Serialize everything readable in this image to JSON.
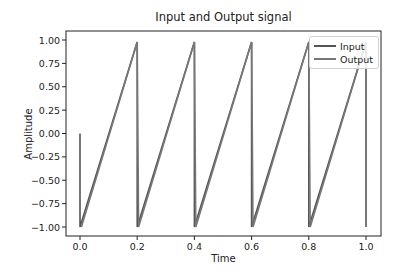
{
  "chart_data": {
    "type": "line",
    "title": "Input and Output signal",
    "xlabel": "Time",
    "ylabel": "Amplitude",
    "xlim": [
      -0.05,
      1.05
    ],
    "ylim": [
      -1.1,
      1.1
    ],
    "xticks": [
      "0.0",
      "0.2",
      "0.4",
      "0.6",
      "0.8",
      "1.0"
    ],
    "yticks": [
      "1.00",
      "0.75",
      "0.50",
      "0.25",
      "0.00",
      "−0.25",
      "−0.50",
      "−0.75",
      "−1.00"
    ],
    "grid": false,
    "legend_position": "upper right",
    "series": [
      {
        "name": "Input",
        "color": "#555555",
        "x": [
          0.0,
          0.0,
          0.2,
          0.2,
          0.4,
          0.4,
          0.6,
          0.6,
          0.8,
          0.8,
          1.0,
          1.0
        ],
        "y": [
          0.0,
          -1.0,
          0.98,
          -1.0,
          0.98,
          -1.0,
          0.98,
          -1.0,
          0.98,
          -1.0,
          0.98,
          -1.0
        ]
      },
      {
        "name": "Output",
        "color": "#777777",
        "x": [
          0.005,
          0.2,
          0.205,
          0.4,
          0.405,
          0.6,
          0.605,
          0.8,
          0.805,
          1.0
        ],
        "y": [
          -1.0,
          0.98,
          -1.0,
          0.98,
          -1.0,
          0.98,
          -1.0,
          0.98,
          -1.0,
          0.98
        ]
      }
    ]
  },
  "legend": {
    "items": [
      {
        "label": "Input"
      },
      {
        "label": "Output"
      }
    ]
  }
}
